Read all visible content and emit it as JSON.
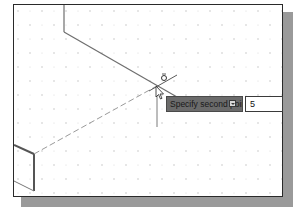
{
  "viewport": {
    "background": "#ffffff",
    "border_color": "#2a2a2a",
    "shadow_color": "#9a9a9a",
    "grid": "isometric-dot-grid"
  },
  "cursor": {
    "type": "crosshair-icon",
    "snap_marker": "snap-marker-icon"
  },
  "command_prompt": {
    "text": "Specify second point or",
    "options_icon": "dropdown-arrow-icon",
    "background": "#6b6b6b"
  },
  "dynamic_input": {
    "value": "5"
  }
}
